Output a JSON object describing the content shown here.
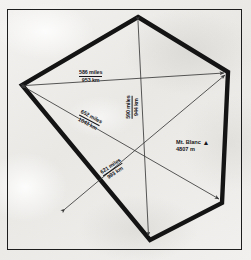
{
  "figure": {
    "type": "geometric-distance-diagram",
    "shape": "pentagon",
    "background_color": "#efeeec",
    "outline_color": "#141414",
    "arrow_color": "#3a3a3a"
  },
  "measurements": [
    {
      "id": "horizontal",
      "name": "west-east-span",
      "miles": "586 miles",
      "km": "953 km",
      "orientation_deg": 0
    },
    {
      "id": "vertical",
      "name": "north-south-span",
      "miles": "590 miles",
      "km": "944 km",
      "orientation_deg": -90
    },
    {
      "id": "nw-se",
      "name": "northwest-southeast-span",
      "miles": "652 miles",
      "km": "1043 km",
      "orientation_deg": 28
    },
    {
      "id": "sw-ne",
      "name": "southwest-northeast-span",
      "miles": "621 miles",
      "km": "993 km",
      "orientation_deg": -34
    }
  ],
  "peak": {
    "name": "Mt. Blanc",
    "elevation": "4807 m",
    "marker_glyph": "▲"
  },
  "pentagon_vertices": [
    {
      "name": "top",
      "x": 138,
      "y": 17
    },
    {
      "name": "right",
      "x": 228,
      "y": 72
    },
    {
      "name": "bottom-right",
      "x": 222,
      "y": 203
    },
    {
      "name": "bottom-left",
      "x": 150,
      "y": 240
    },
    {
      "name": "left",
      "x": 22,
      "y": 85
    }
  ]
}
